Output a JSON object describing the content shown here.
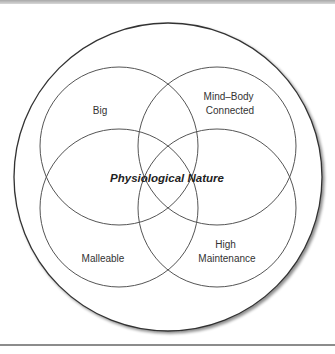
{
  "diagram": {
    "type": "venn",
    "center_label": "Physiological Nature",
    "sets": [
      {
        "label_lines": [
          "Big"
        ],
        "position": "top-left"
      },
      {
        "label_lines": [
          "Mind–Body",
          "Connected"
        ],
        "position": "top-right"
      },
      {
        "label_lines": [
          "Malleable"
        ],
        "position": "bottom-left"
      },
      {
        "label_lines": [
          "High",
          "Maintenance"
        ],
        "position": "bottom-right"
      }
    ],
    "colors": {
      "stroke": "#555555",
      "outer_stroke": "#333333",
      "text": "#333333"
    }
  }
}
